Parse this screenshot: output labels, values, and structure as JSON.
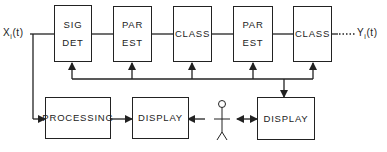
{
  "diagram": {
    "input_label": "X",
    "input_sub": "i",
    "input_arg": "(t)",
    "output_label": "Y",
    "output_sub": "i",
    "output_arg": "(t)",
    "top_row": [
      {
        "line1": "SIG",
        "line2": "DET"
      },
      {
        "line1": "PAR",
        "line2": "EST"
      },
      {
        "line1": "CLASS",
        "line2": ""
      },
      {
        "line1": "PAR",
        "line2": "EST"
      },
      {
        "line1": "CLASS",
        "line2": ""
      }
    ],
    "bottom_row": {
      "processing": "PROCESSING",
      "display_left": "DISPLAY",
      "display_right": "DISPLAY"
    },
    "operator_icon": "stick-figure-person",
    "line_color": "#222222"
  }
}
